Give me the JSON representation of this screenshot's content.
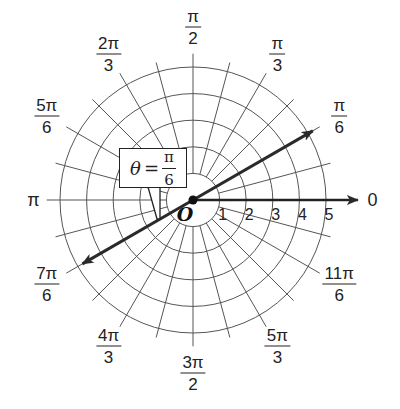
{
  "diagram": {
    "center": {
      "x": 193,
      "y": 200
    },
    "unit_px": 26.6,
    "circles": [
      1,
      2,
      3,
      4,
      5
    ],
    "ray_step_deg": 15,
    "ray_inner_r": 1,
    "ray_outer_r": 5.5,
    "colors": {
      "grid": "#555555",
      "axis": "#222222",
      "line": "#2a2a2a",
      "background": "#ffffff"
    },
    "angle_labels": [
      {
        "num": "",
        "den": "",
        "text": "0",
        "deg": 0,
        "r": 6.75
      },
      {
        "num": "π",
        "den": "6",
        "deg": 30,
        "r": 6.35
      },
      {
        "num": "π",
        "den": "3",
        "deg": 60,
        "r": 6.35
      },
      {
        "num": "π",
        "den": "2",
        "deg": 90,
        "r": 6.5
      },
      {
        "num": "2π",
        "den": "3",
        "deg": 120,
        "r": 6.35
      },
      {
        "num": "5π",
        "den": "6",
        "deg": 150,
        "r": 6.35
      },
      {
        "num": "",
        "den": "",
        "text": "π",
        "deg": 180,
        "r": 6.0
      },
      {
        "num": "7π",
        "den": "6",
        "deg": 210,
        "r": 6.35
      },
      {
        "num": "4π",
        "den": "3",
        "deg": 240,
        "r": 6.35
      },
      {
        "num": "3π",
        "den": "2",
        "deg": 270,
        "r": 6.5
      },
      {
        "num": "5π",
        "den": "3",
        "deg": 300,
        "r": 6.35
      },
      {
        "num": "11π",
        "den": "6",
        "deg": 330,
        "r": 6.35
      }
    ],
    "radial_labels": [
      "1",
      "2",
      "3",
      "4",
      "5"
    ],
    "origin_label": "O",
    "polar_axis": {
      "label": "0",
      "arrow_end_r": 6.2
    },
    "theta_line": {
      "deg": 30,
      "forward_r": 5.2,
      "backward_r": 4.8
    },
    "callout": {
      "theta": "θ",
      "equals": "=",
      "num": "π",
      "den": "6"
    }
  }
}
